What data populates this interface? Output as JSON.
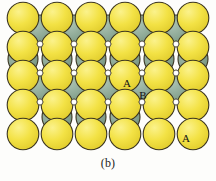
{
  "figure": {
    "caption": "(b)",
    "background_color": "#fdfdfb"
  },
  "colors": {
    "sphere_top_fill": "#f2e03c",
    "sphere_top_fill_light": "#fbf07e",
    "sphere_top_fill_dark": "#dcc726",
    "sphere_bottom_fill": "#8aa894",
    "sphere_bottom_fill_light": "#a9c0b0",
    "sphere_bottom_fill_dark": "#72907d",
    "outline": "#3a3420",
    "interstice": "#ffffff",
    "label_text": "#141414",
    "caption_text": "#1d1d1d"
  },
  "geometry": {
    "radius_top": 15.8,
    "radius_bottom": 15.0,
    "stroke_width": 1.1
  },
  "labels": [
    {
      "text": "A",
      "x": 127,
      "y": 84,
      "name": "label-a-upper"
    },
    {
      "text": "B",
      "x": 143,
      "y": 96,
      "name": "label-b"
    },
    {
      "text": "A",
      "x": 186,
      "y": 139,
      "name": "label-a-lower"
    }
  ],
  "spheres_layer_b": [
    {
      "cx": 40,
      "cy": 30
    },
    {
      "cx": 74,
      "cy": 30
    },
    {
      "cx": 108,
      "cy": 30
    },
    {
      "cx": 142,
      "cy": 30
    },
    {
      "cx": 176,
      "cy": 30
    },
    {
      "cx": 23,
      "cy": 59
    },
    {
      "cx": 57,
      "cy": 59
    },
    {
      "cx": 91,
      "cy": 59
    },
    {
      "cx": 125,
      "cy": 59
    },
    {
      "cx": 159,
      "cy": 59
    },
    {
      "cx": 193,
      "cy": 59
    },
    {
      "cx": 40,
      "cy": 88
    },
    {
      "cx": 74,
      "cy": 88
    },
    {
      "cx": 108,
      "cy": 88
    },
    {
      "cx": 142,
      "cy": 88
    },
    {
      "cx": 176,
      "cy": 88
    },
    {
      "cx": 57,
      "cy": 117
    },
    {
      "cx": 91,
      "cy": 117
    },
    {
      "cx": 125,
      "cy": 117
    }
  ],
  "spheres_layer_a": [
    {
      "cx": 23,
      "cy": 18
    },
    {
      "cx": 57,
      "cy": 18
    },
    {
      "cx": 91,
      "cy": 18
    },
    {
      "cx": 125,
      "cy": 18
    },
    {
      "cx": 159,
      "cy": 18
    },
    {
      "cx": 193,
      "cy": 18
    },
    {
      "cx": 23,
      "cy": 47
    },
    {
      "cx": 57,
      "cy": 47
    },
    {
      "cx": 91,
      "cy": 47
    },
    {
      "cx": 125,
      "cy": 47
    },
    {
      "cx": 159,
      "cy": 47
    },
    {
      "cx": 193,
      "cy": 47
    },
    {
      "cx": 23,
      "cy": 76
    },
    {
      "cx": 57,
      "cy": 76
    },
    {
      "cx": 91,
      "cy": 76
    },
    {
      "cx": 125,
      "cy": 76
    },
    {
      "cx": 159,
      "cy": 76
    },
    {
      "cx": 193,
      "cy": 76
    },
    {
      "cx": 23,
      "cy": 105
    },
    {
      "cx": 57,
      "cy": 105
    },
    {
      "cx": 91,
      "cy": 105
    },
    {
      "cx": 125,
      "cy": 105
    },
    {
      "cx": 159,
      "cy": 105
    },
    {
      "cx": 193,
      "cy": 105
    },
    {
      "cx": 23,
      "cy": 134
    },
    {
      "cx": 57,
      "cy": 134
    },
    {
      "cx": 91,
      "cy": 134
    },
    {
      "cx": 125,
      "cy": 134
    },
    {
      "cx": 159,
      "cy": 134
    },
    {
      "cx": 193,
      "cy": 134
    }
  ],
  "interstices": [
    {
      "cx": 40,
      "cy": 44
    },
    {
      "cx": 74,
      "cy": 44
    },
    {
      "cx": 108,
      "cy": 44
    },
    {
      "cx": 142,
      "cy": 44
    },
    {
      "cx": 176,
      "cy": 44
    },
    {
      "cx": 40,
      "cy": 73
    },
    {
      "cx": 74,
      "cy": 73
    },
    {
      "cx": 108,
      "cy": 73
    },
    {
      "cx": 142,
      "cy": 73
    },
    {
      "cx": 176,
      "cy": 73
    },
    {
      "cx": 40,
      "cy": 102
    },
    {
      "cx": 74,
      "cy": 102
    },
    {
      "cx": 108,
      "cy": 102
    },
    {
      "cx": 142,
      "cy": 102
    },
    {
      "cx": 176,
      "cy": 102
    }
  ]
}
